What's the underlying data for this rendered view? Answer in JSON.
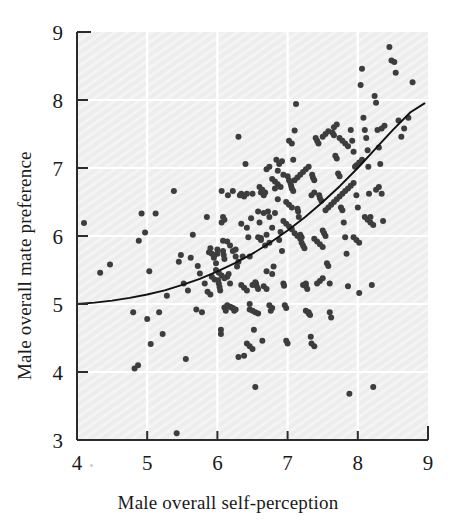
{
  "chart_data": {
    "type": "scatter",
    "title": "",
    "xlabel": "Male overall self-perception",
    "ylabel": "Male overall mate preference",
    "xlim": [
      4,
      9
    ],
    "ylim": [
      3,
      9
    ],
    "xticks": [
      4,
      5,
      6,
      7,
      8,
      9
    ],
    "yticks": [
      3,
      4,
      5,
      6,
      7,
      8,
      9
    ],
    "xtick_labels": [
      "4",
      "5",
      "6",
      "7",
      "8",
      "9"
    ],
    "ytick_labels": [
      "3",
      "4",
      "5",
      "6",
      "7",
      "8",
      "9"
    ],
    "grid": true,
    "grid_color": "#ffffff",
    "plot_background": "#ededed",
    "legend": null,
    "marker_color": "#3d3d3d",
    "marker_size": 6,
    "fit_curve": {
      "name": "quadratic fit",
      "color": "#111111",
      "x": [
        4.0,
        4.25,
        4.5,
        4.75,
        5.0,
        5.25,
        5.5,
        5.75,
        6.0,
        6.25,
        6.5,
        6.75,
        7.0,
        7.25,
        7.5,
        7.75,
        8.0,
        8.25,
        8.5,
        8.75,
        8.95
      ],
      "y": [
        5.0,
        5.02,
        5.05,
        5.09,
        5.14,
        5.2,
        5.28,
        5.37,
        5.48,
        5.6,
        5.74,
        5.9,
        6.08,
        6.28,
        6.5,
        6.74,
        7.0,
        7.28,
        7.56,
        7.82,
        7.95
      ]
    },
    "points": [
      [
        4.1,
        6.19
      ],
      [
        4.33,
        5.46
      ],
      [
        4.47,
        5.58
      ],
      [
        4.8,
        4.88
      ],
      [
        4.82,
        4.05
      ],
      [
        4.87,
        4.1
      ],
      [
        4.88,
        5.93
      ],
      [
        4.92,
        6.33
      ],
      [
        4.97,
        6.05
      ],
      [
        5.0,
        4.78
      ],
      [
        5.03,
        5.48
      ],
      [
        5.05,
        4.41
      ],
      [
        5.12,
        6.33
      ],
      [
        5.17,
        4.88
      ],
      [
        5.22,
        4.56
      ],
      [
        5.28,
        5.12
      ],
      [
        5.38,
        6.66
      ],
      [
        5.42,
        3.1
      ],
      [
        5.45,
        5.62
      ],
      [
        5.48,
        5.72
      ],
      [
        5.52,
        5.3
      ],
      [
        5.55,
        4.19
      ],
      [
        5.58,
        5.2
      ],
      [
        5.62,
        5.68
      ],
      [
        5.65,
        6.02
      ],
      [
        5.7,
        4.92
      ],
      [
        5.72,
        5.56
      ],
      [
        5.75,
        5.45
      ],
      [
        5.78,
        4.88
      ],
      [
        5.82,
        5.3
      ],
      [
        5.85,
        6.28
      ],
      [
        5.88,
        5.76
      ],
      [
        5.9,
        5.82
      ],
      [
        5.92,
        5.74
      ],
      [
        5.95,
        5.68
      ],
      [
        5.96,
        5.72
      ],
      [
        5.98,
        5.6
      ],
      [
        6.0,
        5.8
      ],
      [
        6.0,
        5.74
      ],
      [
        6.01,
        5.35
      ],
      [
        6.02,
        5.3
      ],
      [
        6.03,
        5.25
      ],
      [
        6.04,
        5.2
      ],
      [
        6.05,
        4.56
      ],
      [
        6.05,
        4.62
      ],
      [
        6.06,
        6.66
      ],
      [
        6.08,
        6.28
      ],
      [
        6.08,
        5.93
      ],
      [
        6.08,
        5.78
      ],
      [
        6.09,
        5.72
      ],
      [
        6.1,
        5.66
      ],
      [
        6.1,
        4.95
      ],
      [
        6.12,
        4.9
      ],
      [
        6.14,
        5.4
      ],
      [
        6.15,
        6.6
      ],
      [
        6.16,
        5.44
      ],
      [
        6.18,
        5.3
      ],
      [
        6.2,
        4.95
      ],
      [
        6.22,
        6.66
      ],
      [
        6.24,
        4.9
      ],
      [
        6.26,
        5.8
      ],
      [
        6.28,
        5.55
      ],
      [
        6.3,
        7.46
      ],
      [
        6.3,
        4.22
      ],
      [
        6.32,
        6.6
      ],
      [
        6.34,
        6.18
      ],
      [
        6.36,
        5.7
      ],
      [
        6.38,
        4.24
      ],
      [
        6.4,
        7.06
      ],
      [
        6.42,
        6.62
      ],
      [
        6.44,
        5.98
      ],
      [
        6.46,
        5.0
      ],
      [
        6.48,
        6.26
      ],
      [
        6.5,
        6.62
      ],
      [
        6.52,
        4.62
      ],
      [
        6.54,
        3.78
      ],
      [
        6.55,
        5.3
      ],
      [
        6.56,
        5.26
      ],
      [
        6.58,
        5.22
      ],
      [
        6.6,
        6.2
      ],
      [
        6.62,
        5.97
      ],
      [
        6.64,
        4.46
      ],
      [
        6.66,
        6.6
      ],
      [
        6.68,
        5.86
      ],
      [
        6.7,
        5.48
      ],
      [
        6.72,
        6.36
      ],
      [
        6.74,
        6.28
      ],
      [
        6.76,
        4.9
      ],
      [
        6.78,
        5.44
      ],
      [
        6.8,
        5.55
      ],
      [
        6.82,
        6.7
      ],
      [
        6.84,
        7.12
      ],
      [
        6.86,
        6.96
      ],
      [
        6.88,
        5.94
      ],
      [
        6.9,
        6.06
      ],
      [
        6.92,
        5.78
      ],
      [
        6.94,
        5.3
      ],
      [
        6.95,
        5.27
      ],
      [
        6.96,
        4.98
      ],
      [
        6.98,
        4.94
      ],
      [
        6.98,
        4.46
      ],
      [
        7.0,
        4.42
      ],
      [
        7.0,
        6.88
      ],
      [
        7.02,
        6.82
      ],
      [
        7.04,
        6.78
      ],
      [
        7.05,
        6.74
      ],
      [
        7.06,
        6.7
      ],
      [
        7.08,
        6.66
      ],
      [
        7.08,
        7.12
      ],
      [
        7.1,
        7.55
      ],
      [
        7.12,
        7.94
      ],
      [
        7.14,
        6.4
      ],
      [
        7.15,
        6.36
      ],
      [
        7.16,
        6.28
      ],
      [
        7.18,
        6.02
      ],
      [
        7.2,
        5.98
      ],
      [
        7.2,
        5.9
      ],
      [
        7.22,
        5.86
      ],
      [
        7.24,
        5.82
      ],
      [
        7.26,
        5.3
      ],
      [
        7.26,
        5.26
      ],
      [
        7.28,
        5.22
      ],
      [
        7.3,
        4.88
      ],
      [
        7.32,
        4.84
      ],
      [
        7.33,
        4.52
      ],
      [
        7.35,
        6.9
      ],
      [
        7.36,
        6.86
      ],
      [
        7.38,
        6.82
      ],
      [
        7.4,
        7.44
      ],
      [
        7.42,
        7.4
      ],
      [
        7.44,
        7.36
      ],
      [
        7.45,
        6.6
      ],
      [
        7.46,
        6.56
      ],
      [
        7.48,
        6.52
      ],
      [
        7.5,
        6.08
      ],
      [
        7.52,
        6.04
      ],
      [
        7.54,
        6.0
      ],
      [
        7.56,
        5.6
      ],
      [
        7.58,
        5.56
      ],
      [
        7.6,
        5.3
      ],
      [
        7.6,
        4.88
      ],
      [
        7.62,
        4.8
      ],
      [
        7.64,
        7.52
      ],
      [
        7.66,
        7.48
      ],
      [
        7.68,
        7.18
      ],
      [
        7.7,
        7.14
      ],
      [
        7.72,
        6.92
      ],
      [
        7.74,
        6.88
      ],
      [
        7.76,
        6.42
      ],
      [
        7.78,
        6.38
      ],
      [
        7.8,
        6.2
      ],
      [
        7.82,
        5.98
      ],
      [
        7.84,
        5.74
      ],
      [
        7.86,
        5.26
      ],
      [
        7.88,
        3.68
      ],
      [
        7.9,
        7.56
      ],
      [
        7.92,
        7.4
      ],
      [
        7.94,
        7.24
      ],
      [
        7.96,
        7.02
      ],
      [
        7.98,
        6.6
      ],
      [
        8.0,
        6.42
      ],
      [
        8.02,
        5.16
      ],
      [
        8.04,
        8.22
      ],
      [
        8.06,
        8.46
      ],
      [
        8.08,
        7.74
      ],
      [
        8.1,
        7.56
      ],
      [
        8.12,
        7.44
      ],
      [
        8.14,
        7.26
      ],
      [
        8.15,
        7.02
      ],
      [
        8.16,
        6.62
      ],
      [
        8.18,
        6.28
      ],
      [
        8.2,
        5.28
      ],
      [
        8.22,
        3.78
      ],
      [
        8.24,
        8.06
      ],
      [
        8.26,
        7.96
      ],
      [
        8.28,
        7.56
      ],
      [
        8.3,
        7.3
      ],
      [
        8.32,
        7.06
      ],
      [
        8.34,
        6.62
      ],
      [
        8.36,
        6.22
      ],
      [
        8.45,
        8.78
      ],
      [
        8.48,
        8.58
      ],
      [
        8.52,
        8.56
      ],
      [
        8.54,
        8.4
      ],
      [
        8.58,
        7.7
      ],
      [
        8.62,
        7.46
      ],
      [
        8.66,
        7.58
      ],
      [
        8.72,
        7.74
      ],
      [
        8.78,
        8.26
      ],
      [
        6.58,
        6.36
      ],
      [
        6.62,
        6.64
      ],
      [
        6.66,
        6.34
      ],
      [
        6.7,
        6.02
      ],
      [
        6.74,
        5.9
      ],
      [
        6.78,
        6.12
      ],
      [
        6.82,
        6.34
      ],
      [
        6.86,
        6.54
      ],
      [
        6.9,
        6.72
      ],
      [
        6.94,
        6.9
      ],
      [
        6.34,
        6.62
      ],
      [
        6.38,
        6.58
      ],
      [
        6.42,
        6.12
      ],
      [
        6.46,
        5.7
      ],
      [
        6.5,
        5.28
      ],
      [
        6.54,
        5.32
      ],
      [
        6.14,
        5.92
      ],
      [
        6.18,
        5.86
      ],
      [
        6.22,
        5.78
      ],
      [
        6.26,
        5.7
      ],
      [
        6.3,
        5.62
      ],
      [
        6.34,
        5.28
      ],
      [
        6.38,
        5.24
      ],
      [
        6.42,
        5.2
      ],
      [
        6.46,
        4.92
      ],
      [
        6.5,
        4.9
      ],
      [
        6.54,
        4.88
      ],
      [
        6.58,
        4.86
      ],
      [
        7.1,
        6.04
      ],
      [
        7.14,
        6.0
      ],
      [
        7.18,
        5.96
      ],
      [
        7.22,
        5.28
      ],
      [
        7.26,
        4.9
      ],
      [
        7.3,
        4.86
      ],
      [
        7.34,
        4.42
      ],
      [
        7.38,
        4.38
      ],
      [
        7.42,
        5.3
      ],
      [
        7.46,
        5.34
      ],
      [
        7.5,
        5.38
      ],
      [
        7.54,
        6.38
      ],
      [
        7.58,
        6.42
      ],
      [
        7.62,
        6.46
      ],
      [
        7.66,
        6.5
      ],
      [
        7.7,
        6.54
      ],
      [
        7.1,
        6.82
      ],
      [
        7.14,
        6.86
      ],
      [
        7.18,
        6.9
      ],
      [
        7.22,
        6.94
      ],
      [
        7.26,
        6.98
      ],
      [
        7.3,
        7.02
      ],
      [
        7.02,
        7.4
      ],
      [
        7.06,
        7.36
      ],
      [
        6.88,
        7.06
      ],
      [
        6.92,
        7.1
      ],
      [
        6.7,
        6.98
      ],
      [
        6.74,
        7.02
      ],
      [
        6.78,
        6.84
      ],
      [
        6.82,
        6.8
      ],
      [
        6.86,
        6.76
      ],
      [
        6.6,
        6.72
      ],
      [
        6.64,
        6.68
      ],
      [
        6.68,
        6.64
      ],
      [
        5.98,
        5.5
      ],
      [
        6.02,
        5.46
      ],
      [
        6.06,
        5.42
      ],
      [
        6.1,
        5.38
      ],
      [
        6.14,
        4.98
      ],
      [
        6.18,
        4.96
      ],
      [
        6.22,
        4.94
      ],
      [
        6.26,
        4.92
      ],
      [
        7.74,
        6.58
      ],
      [
        7.78,
        6.62
      ],
      [
        7.82,
        6.66
      ],
      [
        7.86,
        6.7
      ],
      [
        7.9,
        6.74
      ],
      [
        7.94,
        6.78
      ],
      [
        7.98,
        7.04
      ],
      [
        8.02,
        7.08
      ],
      [
        8.06,
        7.12
      ],
      [
        8.1,
        6.28
      ],
      [
        8.14,
        6.24
      ],
      [
        8.18,
        6.2
      ],
      [
        8.22,
        6.16
      ],
      [
        7.66,
        7.6
      ],
      [
        7.7,
        7.64
      ],
      [
        7.74,
        7.44
      ],
      [
        7.78,
        7.4
      ],
      [
        7.82,
        7.36
      ],
      [
        7.86,
        7.32
      ],
      [
        7.5,
        7.46
      ],
      [
        7.54,
        7.5
      ],
      [
        7.58,
        7.54
      ],
      [
        6.06,
        6.2
      ],
      [
        6.1,
        6.24
      ],
      [
        5.92,
        5.4
      ],
      [
        5.96,
        5.36
      ],
      [
        6.58,
        5.98
      ],
      [
        6.62,
        5.94
      ],
      [
        6.66,
        5.26
      ],
      [
        6.7,
        5.22
      ],
      [
        6.74,
        4.98
      ],
      [
        6.78,
        4.94
      ],
      [
        5.86,
        5.18
      ],
      [
        5.9,
        5.14
      ],
      [
        7.94,
        5.98
      ],
      [
        7.98,
        5.94
      ],
      [
        8.02,
        5.9
      ],
      [
        7.38,
        5.96
      ],
      [
        7.42,
        5.92
      ],
      [
        7.46,
        5.88
      ],
      [
        7.5,
        5.84
      ],
      [
        7.02,
        6.46
      ],
      [
        7.06,
        6.42
      ],
      [
        6.98,
        6.5
      ],
      [
        7.34,
        6.6
      ],
      [
        7.38,
        6.64
      ],
      [
        6.94,
        6.22
      ],
      [
        6.98,
        6.18
      ],
      [
        7.02,
        6.14
      ],
      [
        7.06,
        6.1
      ],
      [
        8.26,
        6.68
      ],
      [
        8.3,
        6.72
      ],
      [
        8.34,
        7.58
      ],
      [
        8.38,
        7.62
      ],
      [
        6.42,
        4.42
      ],
      [
        6.46,
        4.38
      ],
      [
        6.5,
        4.34
      ]
    ]
  }
}
